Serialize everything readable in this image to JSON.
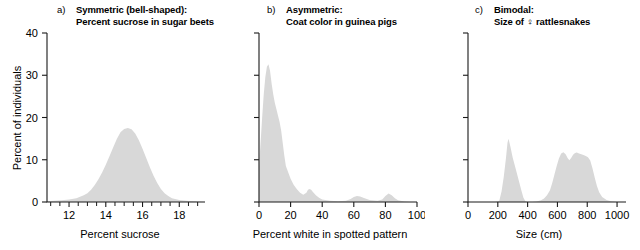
{
  "figure": {
    "background": "#ffffff",
    "fill_color": "#d8d8d8",
    "axis_color": "#1a1a1a",
    "shared_ylabel": "Percent of individuals",
    "shared_yticks": [
      "0",
      "10",
      "20",
      "30",
      "40"
    ]
  },
  "panels": [
    {
      "letter": "a)",
      "title_line1": "Symmetric (bell-shaped):",
      "title_line2": "Percent sucrose in sugar beets",
      "ylabel": "Percent of individuals",
      "xlabel": "Percent sucrose",
      "xticks": [
        "12",
        "14",
        "16",
        "18"
      ]
    },
    {
      "letter": "b)",
      "title_line1": "Asymmetric:",
      "title_line2": "Coat color in guinea pigs",
      "ylabel": "",
      "xlabel": "Percent white in spotted pattern",
      "xticks": [
        "0",
        "20",
        "40",
        "60",
        "80",
        "100"
      ]
    },
    {
      "letter": "c)",
      "title_line1": "Bimodal:",
      "title_line2": "Size of ♀ rattlesnakes",
      "ylabel": "",
      "xlabel": "Size (cm)",
      "xticks": [
        "0",
        "200",
        "400",
        "600",
        "800",
        "1000"
      ]
    }
  ],
  "chart_data": [
    {
      "type": "area",
      "panel": "a",
      "title": "Symmetric (bell-shaped): Percent sucrose in sugar beets",
      "xlabel": "Percent sucrose",
      "ylabel": "Percent of individuals",
      "xlim": [
        10.8,
        19.4
      ],
      "ylim": [
        0,
        40
      ],
      "xtick_values": [
        12,
        14,
        16,
        18
      ],
      "xtick_minor": [
        11,
        11.5,
        12.5,
        13,
        13.5,
        14.5,
        15,
        15.5,
        16.5,
        17,
        17.5,
        18.5,
        19
      ],
      "ytick_values": [
        0,
        10,
        20,
        30,
        40
      ],
      "grid": false,
      "legend": "none",
      "x": [
        10.8,
        11.2,
        11.6,
        12.0,
        12.4,
        12.8,
        13.0,
        13.2,
        13.4,
        13.6,
        13.8,
        14.0,
        14.2,
        14.4,
        14.6,
        14.8,
        15.0,
        15.2,
        15.4,
        15.6,
        15.8,
        16.0,
        16.2,
        16.4,
        16.6,
        16.8,
        17.0,
        17.2,
        17.4,
        17.6,
        18.0,
        18.4,
        19.0,
        19.4
      ],
      "y": [
        0.2,
        0.3,
        0.4,
        0.6,
        0.9,
        1.6,
        2.1,
        2.9,
        4.0,
        5.4,
        7.0,
        8.8,
        10.8,
        12.9,
        14.9,
        16.5,
        17.3,
        17.5,
        17.2,
        16.2,
        14.6,
        12.6,
        10.4,
        8.2,
        6.2,
        4.5,
        3.1,
        2.1,
        1.4,
        0.9,
        0.5,
        0.3,
        0.1,
        0.0
      ]
    },
    {
      "type": "area",
      "panel": "b",
      "title": "Asymmetric: Coat color in guinea pigs",
      "xlabel": "Percent white in spotted pattern",
      "ylabel": "Percent of individuals",
      "xlim": [
        0,
        100
      ],
      "ylim": [
        0,
        40
      ],
      "xtick_values": [
        0,
        20,
        40,
        60,
        80,
        100
      ],
      "ytick_values": [
        0,
        10,
        20,
        30,
        40
      ],
      "grid": false,
      "legend": "none",
      "x": [
        0,
        1,
        2,
        3,
        4,
        5,
        6,
        7,
        8,
        9,
        10,
        11,
        12,
        13,
        14,
        15,
        16,
        17,
        18,
        19,
        20,
        22,
        24,
        26,
        28,
        30,
        31,
        32,
        33,
        34,
        36,
        38,
        40,
        45,
        50,
        55,
        58,
        60,
        62,
        64,
        66,
        70,
        75,
        78,
        80,
        82,
        84,
        86,
        88,
        92,
        96,
        100
      ],
      "y": [
        8.5,
        14.0,
        20.0,
        25.5,
        29.5,
        32.0,
        32.6,
        31.0,
        28.0,
        25.5,
        23.5,
        22.0,
        20.5,
        19.0,
        17.0,
        14.0,
        11.0,
        8.5,
        7.5,
        6.5,
        5.5,
        4.0,
        3.0,
        2.2,
        1.7,
        2.2,
        2.9,
        3.1,
        2.9,
        2.4,
        1.6,
        1.0,
        0.6,
        0.3,
        0.2,
        0.3,
        0.7,
        1.2,
        1.4,
        1.3,
        1.0,
        0.5,
        0.3,
        0.6,
        1.4,
        2.0,
        1.6,
        0.9,
        0.4,
        0.1,
        0.0,
        0.0
      ]
    },
    {
      "type": "area",
      "panel": "c",
      "title": "Bimodal: Size of ♀ rattlesnakes",
      "xlabel": "Size (cm)",
      "ylabel": "Percent of individuals",
      "xlim": [
        0,
        1060
      ],
      "ylim": [
        0,
        40
      ],
      "xtick_values": [
        0,
        200,
        400,
        600,
        800,
        1000
      ],
      "ytick_values": [
        0,
        10,
        20,
        30,
        40
      ],
      "grid": false,
      "legend": "none",
      "x": [
        0,
        100,
        180,
        210,
        225,
        240,
        255,
        265,
        272,
        285,
        300,
        315,
        330,
        345,
        360,
        372,
        385,
        400,
        430,
        460,
        490,
        510,
        530,
        550,
        565,
        580,
        595,
        610,
        625,
        640,
        655,
        668,
        680,
        692,
        705,
        718,
        730,
        745,
        760,
        775,
        790,
        805,
        820,
        835,
        850,
        865,
        880,
        900,
        930,
        960,
        1000,
        1060
      ],
      "y": [
        0.0,
        0.0,
        0.0,
        0.3,
        2.5,
        6.0,
        10.5,
        14.0,
        15.0,
        13.0,
        10.5,
        8.5,
        6.5,
        4.5,
        2.5,
        1.0,
        0.2,
        0.0,
        0.0,
        0.1,
        0.4,
        0.8,
        1.6,
        2.8,
        4.5,
        6.5,
        8.5,
        10.3,
        11.5,
        11.8,
        11.3,
        10.4,
        9.9,
        10.4,
        11.2,
        11.6,
        11.7,
        11.5,
        11.3,
        11.1,
        10.9,
        10.6,
        9.8,
        8.0,
        5.8,
        3.8,
        2.3,
        1.2,
        0.5,
        0.2,
        0.0,
        0.0
      ]
    }
  ]
}
